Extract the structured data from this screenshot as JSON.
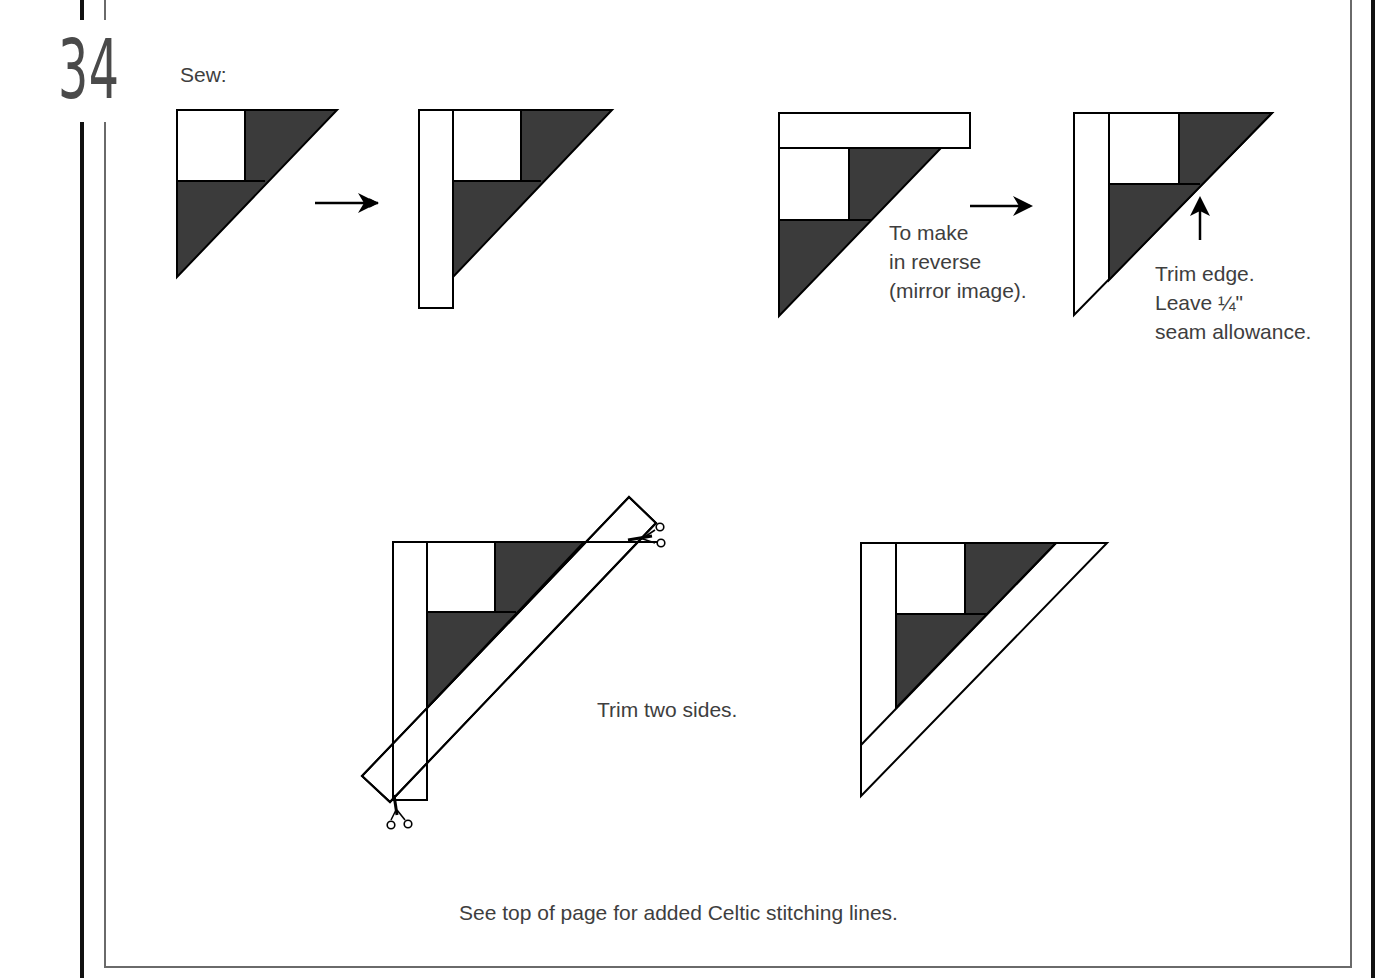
{
  "page": {
    "step_number": "34",
    "instruction_heading": "Sew:",
    "colors": {
      "dark_fabric": "#3b3b3b",
      "light_fabric": "#ffffff",
      "outline": "#000000",
      "text": "#3e3e3e",
      "border_thick": "#111111",
      "border_thin": "#6a6a6a"
    }
  },
  "figures": [
    {
      "id": "fig-1",
      "description": "Half-square block: white square with two dark triangles"
    },
    {
      "id": "fig-2",
      "description": "Block with white strip sewn on left side"
    },
    {
      "id": "fig-3",
      "description": "Block with white strip sewn on top (reverse)"
    },
    {
      "id": "fig-4",
      "description": "Trimmed block with strip"
    },
    {
      "id": "fig-5",
      "description": "Block with diagonal strip overlay and scissors"
    },
    {
      "id": "fig-6",
      "description": "Finished trimmed triangle block"
    }
  ],
  "annotations": {
    "reverse_note": [
      "To make",
      "in reverse",
      "(mirror image)."
    ],
    "trim_note": [
      "Trim edge.",
      "Leave ¼\"",
      "seam allowance."
    ],
    "trim_two_sides": "Trim two sides.",
    "footer_note": "See top of page for added Celtic stitching lines."
  },
  "icons": {
    "arrow_right": "arrow-right-icon",
    "arrow_up": "arrow-up-icon",
    "scissors": "scissors-icon"
  }
}
